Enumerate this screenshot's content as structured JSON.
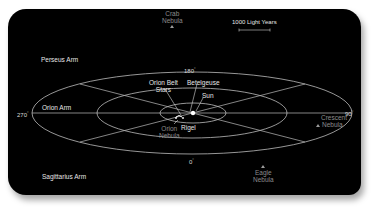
{
  "scale_bar": {
    "label": "1000 Light Years"
  },
  "arms": {
    "perseus": "Perseus Arm",
    "orion": "Orion Arm",
    "sagittarius": "Sagittarius Arm"
  },
  "degrees": {
    "top": "180",
    "right": "90",
    "bottom": "0",
    "left": "270",
    "symbol": "°"
  },
  "stars": {
    "betelgeuse": "Betelgeuse",
    "sun": "Sun",
    "belt_line1": "Orion Belt",
    "belt_line2": "Stars",
    "rigel": "Rigel"
  },
  "nebulae": {
    "crab_line1": "Crab",
    "crab_line2": "Nebula",
    "orion_line1": "Orion",
    "orion_line2": "Nebula",
    "crescent_line1": "Crescent",
    "crescent_line2": "Nebula",
    "eagle_line1": "Eagle",
    "eagle_line2": "Nebula"
  },
  "colors": {
    "background": "#000000",
    "lines": "#bdbdbd",
    "label": "#e6e6e6",
    "dim_label": "#8c8c8c"
  }
}
